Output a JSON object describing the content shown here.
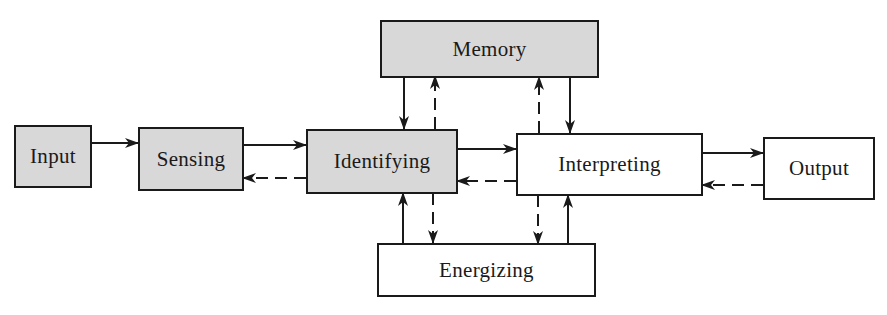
{
  "diagram": {
    "type": "block-flow",
    "colors": {
      "stroke": "#1a1a1a",
      "shaded_fill": "#d8d8d8",
      "plain_fill": "#ffffff"
    },
    "nodes": {
      "input": {
        "label": "Input",
        "shaded": true
      },
      "sensing": {
        "label": "Sensing",
        "shaded": true
      },
      "identifying": {
        "label": "Identifying",
        "shaded": true
      },
      "memory": {
        "label": "Memory",
        "shaded": true
      },
      "interpreting": {
        "label": "Interpreting",
        "shaded": false
      },
      "output": {
        "label": "Output",
        "shaded": false
      },
      "energizing": {
        "label": "Energizing",
        "shaded": false
      }
    },
    "edges": [
      {
        "from": "Input",
        "to": "Sensing",
        "style": "solid"
      },
      {
        "from": "Sensing",
        "to": "Identifying",
        "style": "solid"
      },
      {
        "from": "Identifying",
        "to": "Sensing",
        "style": "dashed"
      },
      {
        "from": "Identifying",
        "to": "Interpreting",
        "style": "solid"
      },
      {
        "from": "Interpreting",
        "to": "Identifying",
        "style": "dashed"
      },
      {
        "from": "Interpreting",
        "to": "Output",
        "style": "solid"
      },
      {
        "from": "Output",
        "to": "Interpreting",
        "style": "dashed"
      },
      {
        "from": "Memory",
        "to": "Identifying",
        "style": "solid"
      },
      {
        "from": "Identifying",
        "to": "Memory",
        "style": "dashed"
      },
      {
        "from": "Interpreting",
        "to": "Memory",
        "style": "dashed"
      },
      {
        "from": "Memory",
        "to": "Interpreting",
        "style": "solid"
      },
      {
        "from": "Energizing",
        "to": "Identifying",
        "style": "solid"
      },
      {
        "from": "Identifying",
        "to": "Energizing",
        "style": "dashed"
      },
      {
        "from": "Interpreting",
        "to": "Energizing",
        "style": "dashed"
      },
      {
        "from": "Energizing",
        "to": "Interpreting",
        "style": "solid"
      }
    ]
  }
}
